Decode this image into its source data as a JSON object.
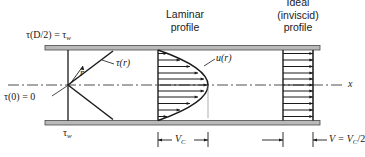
{
  "figure": {
    "labels": {
      "tau_wall_top": "τ(D/2) = τ",
      "tau_wall_top_sub": "w",
      "tau_r": "τ(r)",
      "radius": "r",
      "tau_center": "τ(0) = 0",
      "tau_wall_bottom": "τ",
      "tau_wall_bottom_sub": "w",
      "velocity_profile": "u(r)",
      "axis_x": "x"
    },
    "headings": {
      "laminar_line1": "Laminar",
      "laminar_line2": "profile",
      "ideal_line1": "Ideal",
      "ideal_line2": "(inviscid)",
      "ideal_line3": "profile"
    },
    "dimensions": {
      "centerline_velocity": "V",
      "centerline_velocity_sub": "C",
      "mean_velocity_prefix": "V = V",
      "mean_velocity_sub": "C",
      "mean_velocity_suffix": "/2"
    },
    "colors": {
      "line": "#1a1a1a",
      "wall_fill": "#b9b9b9",
      "wall_edge": "#4a4a4a",
      "background": "#ffffff"
    },
    "geometry": {
      "wall_left_x": 45,
      "wall_right_x": 320,
      "wall_top_y": 48,
      "wall_bottom_y": 122,
      "centerline_y": 85,
      "laminar_base_x": 158,
      "laminar_peak_x": 208,
      "ideal_base_x": 283,
      "ideal_tip_x": 313,
      "laminar_arrow_count": 11,
      "ideal_arrow_count": 11
    }
  }
}
